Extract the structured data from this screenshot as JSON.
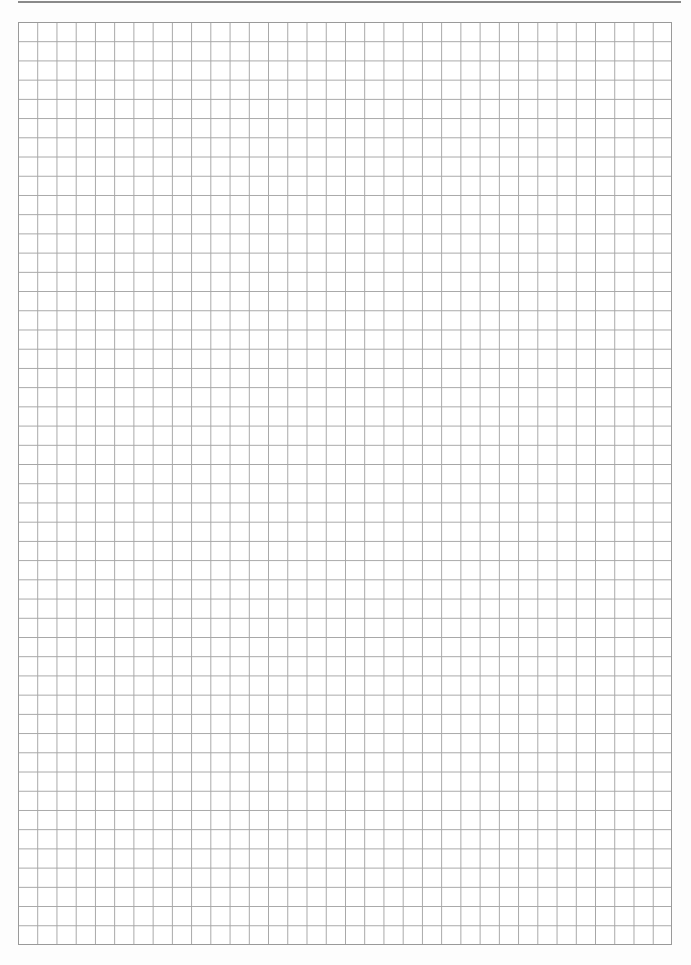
{
  "page": {
    "type": "graph-paper",
    "grid": {
      "columns": 34,
      "rows": 48,
      "line_color": "#a6a6a6",
      "border_color": "#9a9a9a",
      "background_color": "#ffffff"
    },
    "header_rule_color": "#8a8a8a"
  }
}
